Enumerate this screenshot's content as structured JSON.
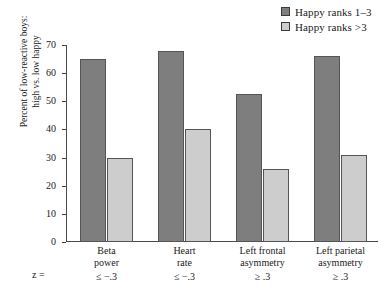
{
  "chart_data": {
    "type": "bar",
    "title": "",
    "xlabel": "",
    "ylabel": "Percent of low-reactive boys: high vs. low happy",
    "ylim": [
      0,
      70
    ],
    "yticks": [
      0,
      10,
      20,
      30,
      40,
      50,
      60,
      70
    ],
    "grid": false,
    "legend_position": "top-right",
    "categories": [
      "Beta power",
      "Heart rate",
      "Left frontal asymmetry",
      "Left parietal asymmetry"
    ],
    "series": [
      {
        "name": "Happy ranks 1–3",
        "color": "#7e7e7e",
        "values": [
          65,
          68,
          52.5,
          66
        ]
      },
      {
        "name": "Happy ranks >3",
        "color": "#cdcdcd",
        "values": [
          30,
          40,
          26,
          31
        ]
      }
    ]
  },
  "legend": {
    "items": [
      {
        "label": "Happy ranks 1–3",
        "swatch": "#7e7e7e"
      },
      {
        "label": "Happy ranks >3",
        "swatch": "#cdcdcd"
      }
    ]
  },
  "axes": {
    "y_title_line1": "Percent of low-reactive boys:",
    "y_title_line2": "high vs. low happy",
    "y_ticks": [
      "70",
      "60",
      "50",
      "40",
      "30",
      "20",
      "10",
      "0"
    ],
    "z_prefix": "z ="
  },
  "x_groups": [
    {
      "line1": "Beta",
      "line2": "power",
      "z": "≤ −.3"
    },
    {
      "line1": "Heart",
      "line2": "rate",
      "z": "≤ −.3"
    },
    {
      "line1": "Left frontal",
      "line2": "asymmetry",
      "z": "≥ .3"
    },
    {
      "line1": "Left parietal",
      "line2": "asymmetry",
      "z": "≥ .3"
    }
  ]
}
